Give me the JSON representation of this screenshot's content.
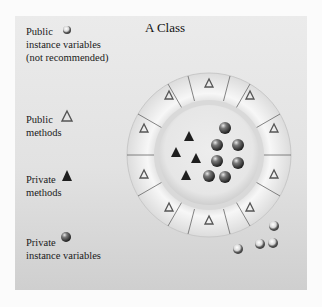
{
  "diagram": {
    "title": "A Class",
    "legend": [
      {
        "key": "public-instance-variables",
        "lines": [
          "Public",
          "instance variables",
          "(not recommended)"
        ],
        "icon": "gray-sphere-icon"
      },
      {
        "key": "public-methods",
        "lines": [
          "Public",
          "methods"
        ],
        "icon": "outline-triangle-icon"
      },
      {
        "key": "private-methods",
        "lines": [
          "Private",
          "methods"
        ],
        "icon": "filled-triangle-icon"
      },
      {
        "key": "private-instance-variables",
        "lines": [
          "Private",
          "instance variables"
        ],
        "icon": "dark-sphere-icon"
      }
    ],
    "ring": {
      "segments": 12,
      "public_methods_count": 12,
      "private_methods_count": 4,
      "private_instance_variables_count": 8,
      "public_instance_variables_count": 4
    },
    "colors": {
      "panel": "#e4e4e4",
      "ring": "#f4f4f4",
      "triangle_stroke": "#555555",
      "triangle_fill": "#1e1e1e",
      "sphere": "#4a4a4a"
    }
  }
}
